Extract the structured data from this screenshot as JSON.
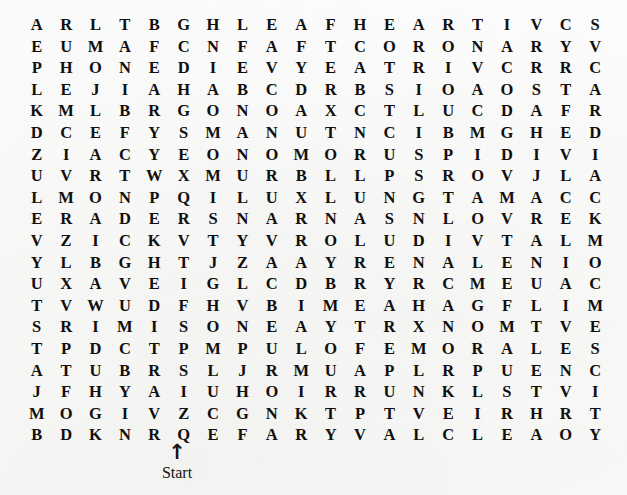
{
  "document": {
    "kind": "word-search-puzzle",
    "grid": {
      "rows": 20,
      "columns": 20,
      "letters": [
        [
          "A",
          "R",
          "L",
          "T",
          "B",
          "G",
          "H",
          "L",
          "E",
          "A",
          "F",
          "H",
          "E",
          "A",
          "R",
          "T",
          "I",
          "V",
          "C",
          "S"
        ],
        [
          "E",
          "U",
          "M",
          "A",
          "F",
          "C",
          "N",
          "F",
          "A",
          "F",
          "T",
          "C",
          "O",
          "R",
          "O",
          "N",
          "A",
          "R",
          "Y",
          "V"
        ],
        [
          "P",
          "H",
          "O",
          "N",
          "E",
          "D",
          "I",
          "E",
          "V",
          "Y",
          "E",
          "A",
          "T",
          "R",
          "I",
          "V",
          "C",
          "R",
          "R",
          "C"
        ],
        [
          "L",
          "E",
          "J",
          "I",
          "A",
          "H",
          "A",
          "B",
          "C",
          "D",
          "R",
          "B",
          "S",
          "I",
          "O",
          "A",
          "O",
          "S",
          "T",
          "A"
        ],
        [
          "K",
          "M",
          "L",
          "B",
          "R",
          "G",
          "O",
          "N",
          "O",
          "A",
          "X",
          "C",
          "T",
          "L",
          "U",
          "C",
          "D",
          "A",
          "F",
          "R"
        ],
        [
          "D",
          "C",
          "E",
          "F",
          "Y",
          "S",
          "M",
          "A",
          "N",
          "U",
          "T",
          "N",
          "C",
          "I",
          "B",
          "M",
          "G",
          "H",
          "E",
          "D"
        ],
        [
          "Z",
          "I",
          "A",
          "C",
          "Y",
          "E",
          "O",
          "N",
          "O",
          "M",
          "O",
          "R",
          "U",
          "S",
          "P",
          "I",
          "D",
          "I",
          "V",
          "I"
        ],
        [
          "U",
          "V",
          "R",
          "T",
          "W",
          "X",
          "M",
          "U",
          "R",
          "B",
          "L",
          "L",
          "P",
          "S",
          "R",
          "O",
          "V",
          "J",
          "L",
          "A"
        ],
        [
          "L",
          "M",
          "O",
          "N",
          "P",
          "Q",
          "I",
          "L",
          "U",
          "X",
          "L",
          "U",
          "N",
          "G",
          "T",
          "A",
          "M",
          "A",
          "C",
          "C"
        ],
        [
          "E",
          "R",
          "A",
          "D",
          "E",
          "R",
          "S",
          "N",
          "A",
          "R",
          "N",
          "A",
          "S",
          "N",
          "L",
          "O",
          "V",
          "R",
          "E",
          "K"
        ],
        [
          "V",
          "Z",
          "I",
          "C",
          "K",
          "V",
          "T",
          "Y",
          "V",
          "R",
          "O",
          "L",
          "U",
          "D",
          "I",
          "V",
          "T",
          "A",
          "L",
          "M"
        ],
        [
          "Y",
          "L",
          "B",
          "G",
          "H",
          "T",
          "J",
          "Z",
          "A",
          "A",
          "Y",
          "R",
          "E",
          "N",
          "A",
          "L",
          "E",
          "N",
          "I",
          "O"
        ],
        [
          "U",
          "X",
          "A",
          "V",
          "E",
          "I",
          "G",
          "L",
          "C",
          "D",
          "B",
          "R",
          "Y",
          "R",
          "C",
          "M",
          "E",
          "U",
          "A",
          "C"
        ],
        [
          "T",
          "V",
          "W",
          "U",
          "D",
          "F",
          "H",
          "V",
          "B",
          "I",
          "M",
          "E",
          "A",
          "H",
          "A",
          "G",
          "F",
          "L",
          "I",
          "M"
        ],
        [
          "S",
          "R",
          "I",
          "M",
          "I",
          "S",
          "O",
          "N",
          "E",
          "A",
          "Y",
          "T",
          "R",
          "X",
          "N",
          "O",
          "M",
          "T",
          "V",
          "E"
        ],
        [
          "T",
          "P",
          "D",
          "C",
          "T",
          "P",
          "M",
          "P",
          "U",
          "L",
          "O",
          "F",
          "E",
          "M",
          "O",
          "R",
          "A",
          "L",
          "E",
          "S"
        ],
        [
          "A",
          "T",
          "U",
          "B",
          "R",
          "S",
          "L",
          "J",
          "R",
          "M",
          "U",
          "A",
          "P",
          "L",
          "R",
          "P",
          "U",
          "E",
          "N",
          "C"
        ],
        [
          "J",
          "F",
          "H",
          "Y",
          "A",
          "I",
          "U",
          "H",
          "O",
          "I",
          "R",
          "R",
          "U",
          "N",
          "K",
          "L",
          "S",
          "T",
          "V",
          "I"
        ],
        [
          "M",
          "O",
          "G",
          "I",
          "V",
          "Z",
          "C",
          "G",
          "N",
          "K",
          "T",
          "P",
          "T",
          "V",
          "E",
          "I",
          "R",
          "H",
          "R",
          "T"
        ],
        [
          "B",
          "D",
          "K",
          "N",
          "R",
          "Q",
          "E",
          "F",
          "A",
          "R",
          "Y",
          "V",
          "A",
          "L",
          "C",
          "L",
          "E",
          "A",
          "O",
          "Y"
        ]
      ]
    },
    "annotation": {
      "arrow": "↑",
      "arrow_icon_name": "up-arrow-icon",
      "label": "Start",
      "points_to": {
        "row": 20,
        "column": 5,
        "letter": "R"
      }
    },
    "colors": {
      "ink": "#100f0d",
      "page": "#fdfdfc"
    }
  }
}
